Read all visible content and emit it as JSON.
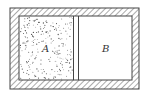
{
  "diagram": {
    "type": "insulated container with partition",
    "chambers": [
      {
        "label": "A",
        "content": "gas (dotted fill)"
      },
      {
        "label": "B",
        "content": "empty / vacuum"
      }
    ],
    "partition": "movable/removable double-line partition between A and B",
    "walls": "hatched insulated walls"
  }
}
